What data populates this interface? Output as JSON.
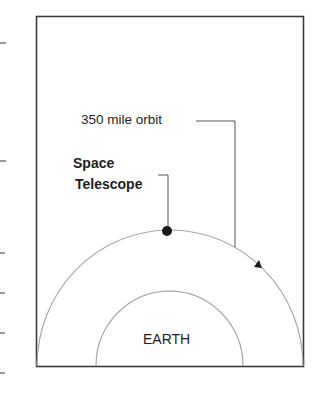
{
  "diagram": {
    "labels": {
      "orbit": "350 mile orbit",
      "telescope_line1": "Space",
      "telescope_line2": "Telescope",
      "earth": "EARTH"
    },
    "colors": {
      "frame": "#3a3a3a",
      "arc": "#a8a8a8",
      "text": "#1e1e1e",
      "marker": "#1a1a1a"
    },
    "margin_ticks_y": [
      43,
      161,
      253,
      293,
      333,
      373
    ]
  }
}
